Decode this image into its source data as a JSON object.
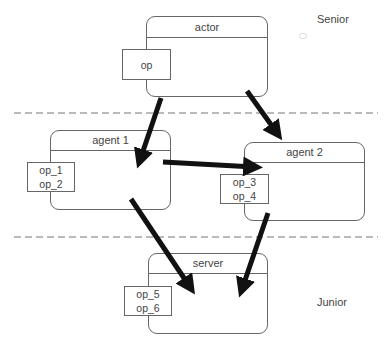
{
  "levels": {
    "top": "Senior",
    "bottom": "Junior"
  },
  "nodes": [
    {
      "id": "actor",
      "title": "actor",
      "ops": [
        "op"
      ]
    },
    {
      "id": "agent1",
      "title": "agent 1",
      "ops": [
        "op_1",
        "op_2"
      ]
    },
    {
      "id": "agent2",
      "title": "agent 2",
      "ops": [
        "op_3",
        "op_4"
      ]
    },
    {
      "id": "server",
      "title": "server",
      "ops": [
        "op_5",
        "op_6"
      ]
    }
  ],
  "edges": [
    {
      "from": "actor",
      "to": "agent 1"
    },
    {
      "from": "actor",
      "to": "agent 2"
    },
    {
      "from": "agent 1",
      "to": "agent 2"
    },
    {
      "from": "agent 1",
      "to": "server"
    },
    {
      "from": "agent 2",
      "to": "server"
    }
  ],
  "colors": {
    "arrow": "#111111",
    "border": "#666666",
    "divider": "#777777"
  }
}
